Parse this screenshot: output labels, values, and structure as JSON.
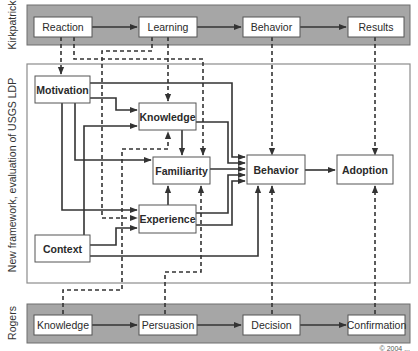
{
  "kirkpatrick": {
    "label": "Kirkpatrick",
    "boxes": [
      "Reaction",
      "Learning",
      "Behavior",
      "Results"
    ]
  },
  "framework": {
    "label": "New framework, evaluation of USGS LDP",
    "boxes": {
      "motivation": "Motivation",
      "knowledge": "Knowledge",
      "familiarity": "Familiarity",
      "experience": "Experience",
      "context": "Context",
      "behavior": "Behavior",
      "adoption": "Adoption"
    }
  },
  "rogers": {
    "label": "Rogers",
    "boxes": [
      "Knowledge",
      "Persuasion",
      "Decision",
      "Confirmation"
    ]
  },
  "footer": {
    "copyright": "© 2004 ..."
  },
  "colors": {
    "band": "#a6a6a6",
    "line": "#333333"
  }
}
